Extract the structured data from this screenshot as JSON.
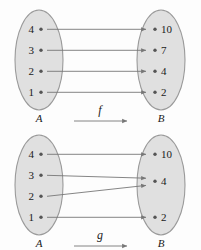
{
  "figure": {
    "colors": {
      "set_fill": "#e0e0e0",
      "set_stroke": "#9a9a9a",
      "arrow": "#777777",
      "dot": "#555555",
      "text": "#1a1a1a",
      "background": "#fdfdfd"
    }
  },
  "diagrams": [
    {
      "id": "f",
      "function_label": "f",
      "domain": {
        "set_label": "A",
        "elements": [
          "4",
          "3",
          "2",
          "1"
        ]
      },
      "codomain": {
        "set_label": "B",
        "elements": [
          "10",
          "7",
          "4",
          "2"
        ]
      },
      "mappings": [
        {
          "from": "4",
          "to": "10"
        },
        {
          "from": "3",
          "to": "7"
        },
        {
          "from": "2",
          "to": "4"
        },
        {
          "from": "1",
          "to": "2"
        }
      ]
    },
    {
      "id": "g",
      "function_label": "g",
      "domain": {
        "set_label": "A",
        "elements": [
          "4",
          "3",
          "2",
          "1"
        ]
      },
      "codomain": {
        "set_label": "B",
        "elements": [
          "10",
          "4",
          "2"
        ]
      },
      "mappings": [
        {
          "from": "4",
          "to": "10"
        },
        {
          "from": "3",
          "to": "4"
        },
        {
          "from": "2",
          "to": "4"
        },
        {
          "from": "1",
          "to": "2"
        }
      ]
    }
  ]
}
